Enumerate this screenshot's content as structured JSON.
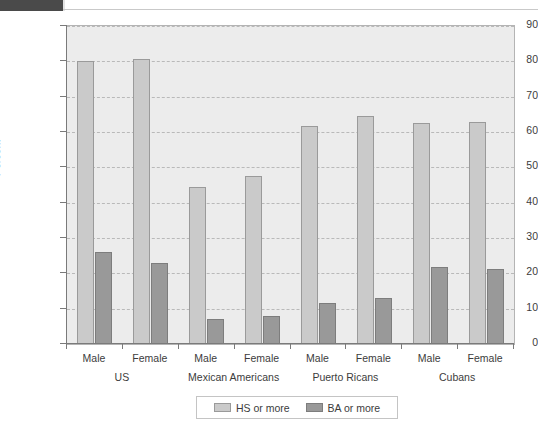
{
  "chart_data": {
    "type": "bar",
    "title": "",
    "subtitle": "",
    "xlabel": "",
    "ylabel": "Percent",
    "ylim": [
      0,
      90
    ],
    "ytick_step": 10,
    "yticks": [
      "90",
      "80",
      "70",
      "60",
      "50",
      "40",
      "30",
      "20",
      "10",
      "0"
    ],
    "grid": true,
    "grid_style": "dashed-horizontal",
    "legend_position": "bottom-center",
    "categories": [
      "US Male",
      "US Female",
      "Mexican Americans Male",
      "Mexican Americans Female",
      "Puerto Ricans Male",
      "Puerto Ricans Female",
      "Cubans Male",
      "Cubans Female"
    ],
    "group_labels": [
      "US",
      "Mexican Americans",
      "Puerto Ricans",
      "Cubans"
    ],
    "sex_labels": [
      "Male",
      "Female",
      "Male",
      "Female",
      "Male",
      "Female",
      "Male",
      "Female"
    ],
    "series": [
      {
        "name": "HS or more",
        "color": "#cacaca",
        "values": [
          80.0,
          80.8,
          44.5,
          47.6,
          61.6,
          64.4,
          62.5,
          62.9
        ]
      },
      {
        "name": "BA or more",
        "color": "#999999",
        "values": [
          26.1,
          22.8,
          7.1,
          8.0,
          11.7,
          13.1,
          21.8,
          21.1
        ]
      }
    ]
  },
  "legend": {
    "entries": [
      {
        "label": "HS or more"
      },
      {
        "label": "BA or more"
      }
    ]
  },
  "axis": {
    "y_title": "Percent"
  }
}
